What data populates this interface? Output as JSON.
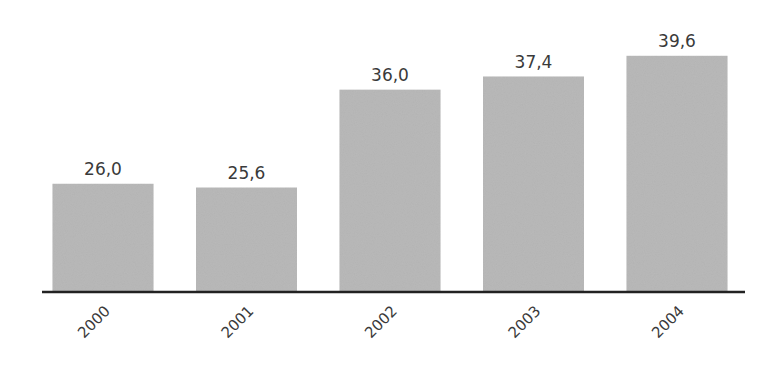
{
  "chart_data": {
    "type": "bar",
    "title": "",
    "xlabel": "",
    "ylabel": "",
    "categories": [
      "2000",
      "2001",
      "2002",
      "2003",
      "2004"
    ],
    "values": [
      26.0,
      25.6,
      36.0,
      37.4,
      39.6
    ],
    "value_labels": [
      "26,0",
      "25,6",
      "36,0",
      "37,4",
      "39,6"
    ],
    "ylim": [
      14.5,
      42
    ],
    "grid": false,
    "legend": "none",
    "colors": {
      "bar": "#b4b4b4",
      "axis": "#222222",
      "text": "#3a3a3a"
    }
  }
}
